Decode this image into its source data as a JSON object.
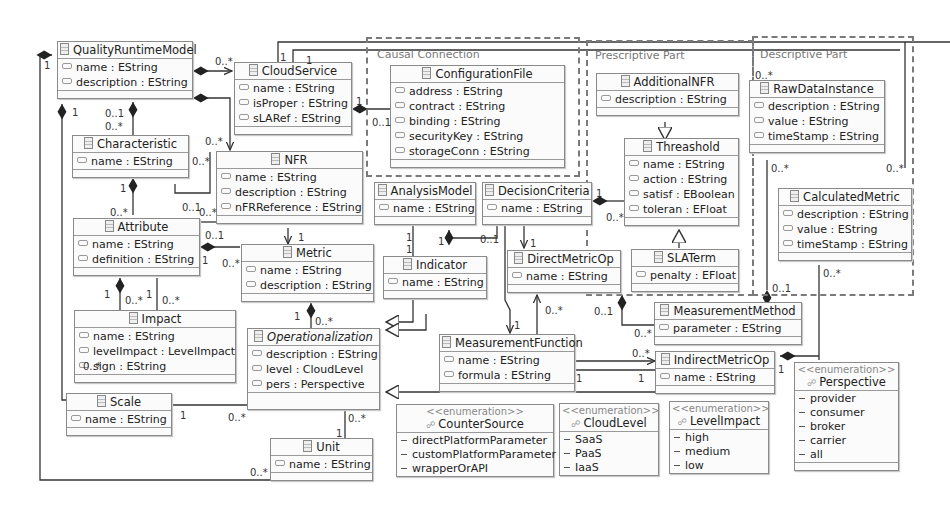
{
  "frames": [
    {
      "id": "causal",
      "label": "Causal Connection"
    },
    {
      "id": "prescriptive",
      "label": "Prescriptive Part"
    },
    {
      "id": "descriptive",
      "label": "Descriptive Part"
    }
  ],
  "classes": {
    "QualityRuntimeModel": {
      "name": "QualityRuntimeModel",
      "attrs": [
        "name : EString",
        "description : EString"
      ]
    },
    "CloudService": {
      "name": "CloudService",
      "attrs": [
        "name : EString",
        "isProper : EString",
        "sLARef : EString"
      ]
    },
    "ConfigurationFile": {
      "name": "ConfigurationFile",
      "attrs": [
        "address : EString",
        "contract : EString",
        "binding : EString",
        "securityKey : EString",
        "storageConn : EString"
      ]
    },
    "AdditionalNFR": {
      "name": "AdditionalNFR",
      "attrs": [
        "description : EString"
      ]
    },
    "Threashold": {
      "name": "Threashold",
      "attrs": [
        "name : EString",
        "action : EString",
        "satisf : EBoolean",
        "toleran : EFloat"
      ]
    },
    "SLATerm": {
      "name": "SLATerm",
      "attrs": [
        "penalty : EFloat"
      ]
    },
    "RawDataInstance": {
      "name": "RawDataInstance",
      "attrs": [
        "description : EString",
        "value : EString",
        "timeStamp : EString"
      ]
    },
    "CalculatedMetric": {
      "name": "CalculatedMetric",
      "attrs": [
        "description : EString",
        "value : EString",
        "timeStamp : EString"
      ]
    },
    "Characteristic": {
      "name": "Characteristic",
      "attrs": [
        "name : EString"
      ]
    },
    "NFR": {
      "name": "NFR",
      "attrs": [
        "name : EString",
        "description : EString",
        "nFRReference : EString"
      ]
    },
    "Attribute": {
      "name": "Attribute",
      "attrs": [
        "name : EString",
        "definition : EString"
      ]
    },
    "Metric": {
      "name": "Metric",
      "attrs": [
        "name : EString",
        "description : EString"
      ]
    },
    "AnalysisModel": {
      "name": "AnalysisModel",
      "attrs": [
        "name : EString"
      ]
    },
    "DecisionCriteria": {
      "name": "DecisionCriteria",
      "attrs": [
        "name : EString"
      ]
    },
    "Indicator": {
      "name": "Indicator",
      "attrs": [
        "name : EString"
      ]
    },
    "DirectMetricOp": {
      "name": "DirectMetricOp",
      "attrs": [
        "name : EString"
      ]
    },
    "MeasurementMethod": {
      "name": "MeasurementMethod",
      "attrs": [
        "parameter : EString"
      ]
    },
    "Impact": {
      "name": "Impact",
      "attrs": [
        "name : EString",
        "levelImpact : LevelImpact",
        "sign : EString"
      ]
    },
    "Operationalization": {
      "name": "Operationalization",
      "attrs": [
        "description : EString",
        "level : CloudLevel",
        "pers : Perspective"
      ]
    },
    "MeasurementFunction": {
      "name": "MeasurementFunction",
      "attrs": [
        "name : EString",
        "formula : EString"
      ]
    },
    "IndirectMetricOp": {
      "name": "IndirectMetricOp",
      "attrs": [
        "name : EString"
      ]
    },
    "Scale": {
      "name": "Scale",
      "attrs": [
        "name : EString"
      ]
    },
    "Unit": {
      "name": "Unit",
      "attrs": [
        "name : EString"
      ]
    }
  },
  "enums": {
    "stereotype": "<<enumeration>>",
    "CounterSource": {
      "name": "CounterSource",
      "literals": [
        "directPlatformParameter",
        "customPlatformParameter",
        "wrapperOrAPI"
      ]
    },
    "CloudLevel": {
      "name": "CloudLevel",
      "literals": [
        "SaaS",
        "PaaS",
        "IaaS"
      ]
    },
    "LevelImpact": {
      "name": "LevelImpact",
      "literals": [
        "high",
        "medium",
        "low"
      ]
    },
    "Perspective": {
      "name": "Perspective",
      "literals": [
        "provider",
        "consumer",
        "broker",
        "carrier",
        "all"
      ]
    }
  },
  "multiplicities": {
    "one": "1",
    "many": "0..*",
    "opt": "0..1"
  },
  "icons": {
    "class": "class-icon",
    "attribute": "attribute-icon",
    "enumeration": "enumeration-icon",
    "literal": "literal-icon"
  }
}
